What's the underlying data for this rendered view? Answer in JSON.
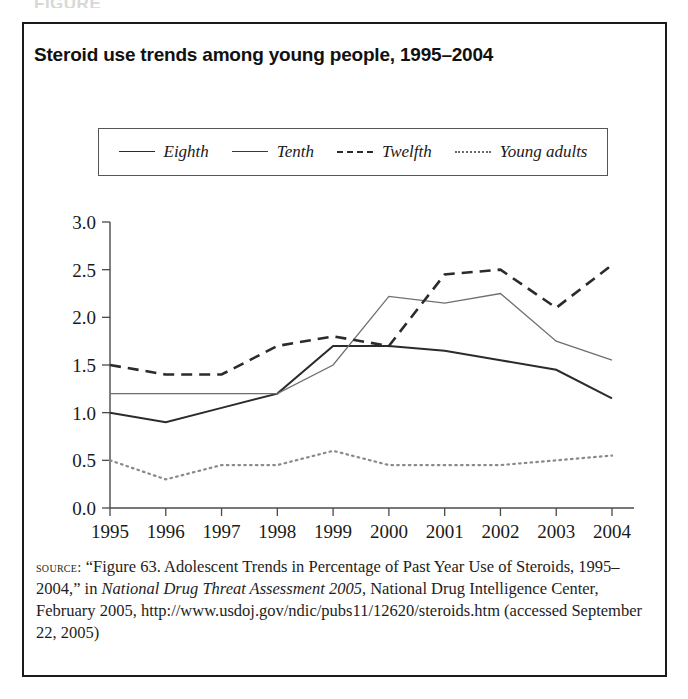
{
  "figure_remnant": "FIGURE",
  "title": "Steroid use trends among young people, 1995–2004",
  "legend": {
    "entries": [
      {
        "label": "Eighth",
        "style": "solid",
        "color": "#2b2b2b"
      },
      {
        "label": "Tenth",
        "style": "solid",
        "color": "#3a3a3a"
      },
      {
        "label": "Twelfth",
        "style": "dashed",
        "color": "#2b2b2b"
      },
      {
        "label": "Young adults",
        "style": "dotted",
        "color": "#6a6a6a"
      }
    ]
  },
  "axis": {
    "y_ticks": [
      "0.0",
      "0.5",
      "1.0",
      "1.5",
      "2.0",
      "2.5",
      "3.0"
    ],
    "x_ticks": [
      "1995",
      "1996",
      "1997",
      "1998",
      "1999",
      "2000",
      "2001",
      "2002",
      "2003",
      "2004"
    ]
  },
  "source": {
    "label": "source:",
    "line1": " “Figure 63. Adolescent Trends in Percentage of Past Year Use of Steroids, 1995–2004,” in ",
    "italic": "National Drug Threat Assessment 2005",
    "line2": ", National Drug Intelligence Center, February 2005, http://www.usdoj.gov/ndic/pubs11/12620/steroids.htm (accessed September 22, 2005)"
  },
  "chart_data": {
    "type": "line",
    "title": "Steroid use trends among young people, 1995–2004",
    "xlabel": "",
    "ylabel": "",
    "x": [
      1995,
      1996,
      1997,
      1998,
      1999,
      2000,
      2001,
      2002,
      2003,
      2004
    ],
    "categories": [
      "1995",
      "1996",
      "1997",
      "1998",
      "1999",
      "2000",
      "2001",
      "2002",
      "2003",
      "2004"
    ],
    "ylim": [
      0.0,
      3.0
    ],
    "ytick_step": 0.5,
    "grid": false,
    "legend_position": "top",
    "series": [
      {
        "name": "Eighth",
        "style": "solid",
        "color": "#2b2b2b",
        "values": [
          1.0,
          0.9,
          1.05,
          1.2,
          1.7,
          1.7,
          1.65,
          1.55,
          1.45,
          1.15
        ]
      },
      {
        "name": "Tenth",
        "style": "solid",
        "color": "#6f6f6f",
        "values": [
          1.2,
          1.2,
          1.2,
          1.2,
          1.5,
          2.22,
          2.15,
          2.25,
          1.75,
          1.55
        ]
      },
      {
        "name": "Twelfth",
        "style": "dashed",
        "color": "#2b2b2b",
        "values": [
          1.5,
          1.4,
          1.4,
          1.7,
          1.8,
          1.7,
          2.45,
          2.5,
          2.1,
          2.55
        ]
      },
      {
        "name": "Young adults",
        "style": "dotted",
        "color": "#8a8a8a",
        "values": [
          0.5,
          0.3,
          0.45,
          0.45,
          0.6,
          0.45,
          0.45,
          0.45,
          0.5,
          0.55
        ]
      }
    ]
  }
}
